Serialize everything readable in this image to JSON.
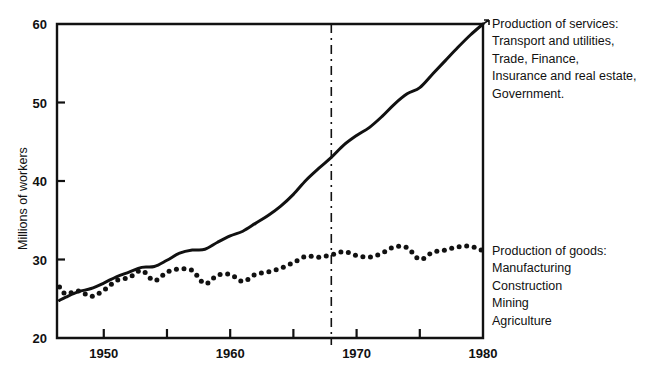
{
  "chart_data": {
    "type": "line",
    "title": "",
    "xlabel": "",
    "ylabel": "Millions of workers",
    "xlim": [
      1946.3,
      1980
    ],
    "ylim": [
      20,
      60
    ],
    "xticks": [
      1950,
      1955,
      1960,
      1965,
      1970,
      1975,
      1980
    ],
    "xtick_labels": [
      "1950",
      "",
      "1960",
      "",
      "1970",
      "",
      "1980"
    ],
    "yticks": [
      20,
      30,
      40,
      50,
      60
    ],
    "ytick_labels": [
      "20",
      "30",
      "40",
      "50",
      "60"
    ],
    "grid": false,
    "legend_position": "right-annotations",
    "series": [
      {
        "name": "Production of services",
        "style": "solid",
        "x": [
          1946.5,
          1947,
          1948,
          1949,
          1950,
          1951,
          1952,
          1953,
          1954,
          1955,
          1956,
          1957,
          1958,
          1959,
          1960,
          1961,
          1962,
          1963,
          1964,
          1965,
          1966,
          1967,
          1968,
          1969,
          1970,
          1971,
          1972,
          1973,
          1974,
          1975,
          1976,
          1977,
          1978,
          1979,
          1980
        ],
        "y": [
          24.8,
          25.2,
          25.9,
          26.3,
          27.0,
          27.8,
          28.4,
          29.0,
          29.1,
          29.9,
          30.8,
          31.2,
          31.3,
          32.2,
          33.0,
          33.6,
          34.6,
          35.6,
          36.8,
          38.3,
          40.1,
          41.6,
          43.0,
          44.6,
          45.8,
          46.8,
          48.2,
          49.8,
          51.1,
          51.9,
          53.6,
          55.3,
          57.0,
          58.6,
          60.0
        ]
      },
      {
        "name": "Production of goods",
        "style": "dotted",
        "x": [
          1946.5,
          1947,
          1948,
          1949,
          1950,
          1951,
          1952,
          1953,
          1954,
          1955,
          1956,
          1957,
          1958,
          1959,
          1960,
          1961,
          1962,
          1963,
          1964,
          1965,
          1966,
          1967,
          1968,
          1969,
          1970,
          1971,
          1972,
          1973,
          1974,
          1975,
          1976,
          1977,
          1978,
          1979,
          1980
        ],
        "y": [
          26.5,
          25.6,
          26.0,
          25.3,
          26.1,
          27.3,
          27.7,
          28.6,
          27.3,
          28.4,
          28.8,
          28.6,
          26.9,
          28.0,
          28.1,
          27.2,
          28.1,
          28.4,
          28.9,
          29.6,
          30.4,
          30.3,
          30.6,
          31.0,
          30.5,
          30.3,
          30.8,
          31.6,
          31.5,
          30.0,
          30.9,
          31.2,
          31.6,
          31.7,
          31.1
        ]
      }
    ],
    "annotations": [
      {
        "name": "marker-line",
        "type": "vertical-dashed-line",
        "x": 1968,
        "label": ""
      },
      {
        "name": "services-label",
        "lines": [
          "Production of services:",
          "Transport and utilities,",
          "Trade, Finance,",
          "Insurance and real estate,",
          "Government."
        ]
      },
      {
        "name": "goods-label",
        "lines": [
          "Production of goods:",
          "Manufacturing",
          "Construction",
          "Mining",
          "Agriculture"
        ]
      }
    ],
    "colors": {
      "ink": "#111111",
      "background": "#ffffff"
    }
  }
}
